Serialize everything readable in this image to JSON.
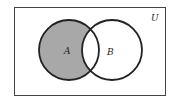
{
  "diagram": {
    "type": "venn",
    "universe_label": "U",
    "sets": [
      {
        "label": "A",
        "cx": 69,
        "cy": 50,
        "r": 30
      },
      {
        "label": "B",
        "cx": 112,
        "cy": 50,
        "r": 30
      }
    ],
    "shaded_region": "A minus B",
    "colors": {
      "shade": "#a8a8a8",
      "stroke": "#222222",
      "frame": "#444444",
      "background": "#ffffff"
    }
  }
}
